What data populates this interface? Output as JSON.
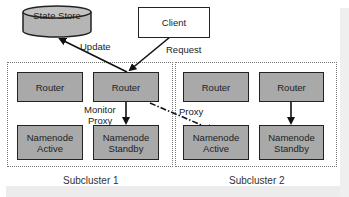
{
  "diagram": {
    "state_store": {
      "label": "State Store"
    },
    "client": {
      "label": "Client"
    },
    "edges": {
      "update": "Update",
      "request": "Request",
      "monitor_proxy_line1": "Monitor",
      "monitor_proxy_line2": "Proxy",
      "proxy": "Proxy"
    },
    "subclusters": [
      {
        "label": "Subcluster 1",
        "routers": [
          "Router",
          "Router"
        ],
        "namenodes": [
          {
            "line1": "Namenode",
            "line2": "Active"
          },
          {
            "line1": "Namenode",
            "line2": "Standby"
          }
        ]
      },
      {
        "label": "Subcluster 2",
        "routers": [
          "Router",
          "Router"
        ],
        "namenodes": [
          {
            "line1": "Namenode",
            "line2": "Active"
          },
          {
            "line1": "Namenode",
            "line2": "Standby"
          }
        ]
      }
    ],
    "colors": {
      "node_fill": "#a9a9a9",
      "cylinder_fill": "#b5b5b5",
      "border": "#222222",
      "cluster_border": "#777777"
    }
  }
}
